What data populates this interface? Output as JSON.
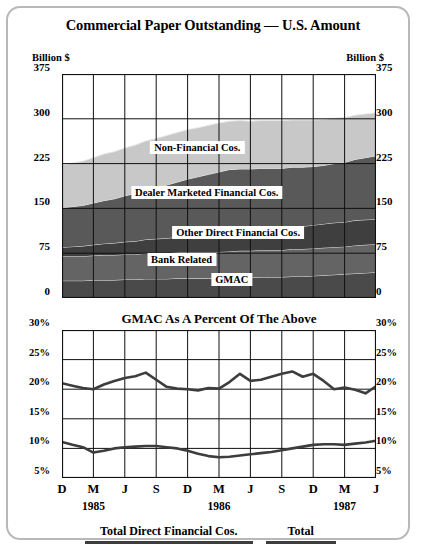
{
  "title": "Commercial Paper Outstanding — U.S. Amount",
  "subtitle": "GMAC As A Percent Of The Above",
  "unit_label_left": "Billion $",
  "unit_label_right": "Billion $",
  "axis": {
    "top_yticks": [
      "375",
      "300",
      "225",
      "150",
      "75",
      "0"
    ],
    "bottom_yticks": [
      "30%",
      "25%",
      "20%",
      "15%",
      "10%",
      "5%"
    ],
    "xticks": [
      "D",
      "M",
      "J",
      "S",
      "D",
      "M",
      "J",
      "S",
      "D",
      "M",
      "J"
    ],
    "years": [
      {
        "label": "1985",
        "at": 1
      },
      {
        "label": "1986",
        "at": 5
      },
      {
        "label": "1987",
        "at": 9
      }
    ]
  },
  "legend": [
    {
      "label": "Total Direct Financial Cos.",
      "color": "#3d3d3d"
    },
    {
      "label": "Total",
      "color": "#3d3d3d"
    }
  ],
  "band_labels": [
    {
      "text": "Non-Financial Cos.",
      "x": 0.45,
      "y": 0.355
    },
    {
      "text": "Dealer Marketed Financial Cos.",
      "x": 0.48,
      "y": 0.56
    },
    {
      "text": "Other Direct Financial Cos.",
      "x": 0.58,
      "y": 0.735
    },
    {
      "text": "Bank Related",
      "x": 0.4,
      "y": 0.855
    },
    {
      "text": "GMAC",
      "x": 0.56,
      "y": 0.945
    }
  ],
  "chart_data": [
    {
      "type": "area",
      "title": "Commercial Paper Outstanding — U.S. Amount",
      "ylabel": "Billion $",
      "xlabel": "",
      "ylim": [
        0,
        375
      ],
      "grid": true,
      "stacked": true,
      "x": [
        "D 1985",
        "J",
        "F",
        "M 1985",
        "A",
        "M",
        "J 1985",
        "J",
        "A",
        "S 1985",
        "O",
        "N",
        "D 1986",
        "J",
        "F",
        "M 1986",
        "A",
        "M",
        "J 1986",
        "J",
        "A",
        "S 1986",
        "O",
        "N",
        "D 1987",
        "J",
        "F",
        "M 1987",
        "A",
        "M",
        "J 1987"
      ],
      "series": [
        {
          "name": "GMAC",
          "color": "#4a4a4a",
          "values": [
            29,
            29,
            29,
            30,
            30,
            30,
            31,
            31,
            32,
            32,
            32,
            33,
            33,
            33,
            33,
            33,
            34,
            34,
            34,
            35,
            35,
            35,
            36,
            36,
            37,
            38,
            39,
            40,
            41,
            42,
            43
          ]
        },
        {
          "name": "Bank Related",
          "color": "#646464",
          "values": [
            41,
            41,
            41,
            41,
            42,
            42,
            42,
            42,
            43,
            43,
            43,
            43,
            44,
            44,
            44,
            44,
            44,
            45,
            45,
            45,
            45,
            45,
            46,
            46,
            46,
            46,
            46,
            46,
            47,
            47,
            47
          ]
        },
        {
          "name": "Other Direct Financial Cos.",
          "color": "#3f3f3f",
          "values": [
            15,
            16,
            17,
            18,
            19,
            20,
            21,
            22,
            23,
            24,
            25,
            26,
            27,
            28,
            29,
            30,
            31,
            32,
            33,
            34,
            35,
            36,
            37,
            38,
            39,
            40,
            41,
            41,
            42,
            42,
            42
          ]
        },
        {
          "name": "Dealer Marketed Financial Cos.",
          "color": "#595959",
          "values": [
            66,
            67,
            68,
            70,
            72,
            74,
            77,
            80,
            83,
            86,
            89,
            92,
            95,
            98,
            101,
            104,
            106,
            105,
            104,
            103,
            102,
            101,
            100,
            99,
            98,
            98,
            99,
            100,
            102,
            104,
            106
          ]
        },
        {
          "name": "Non-Financial Cos.",
          "color": "#c8c8c8",
          "values": [
            72,
            73,
            74,
            76,
            78,
            79,
            80,
            81,
            82,
            82,
            83,
            83,
            83,
            82,
            82,
            82,
            81,
            81,
            80,
            80,
            80,
            80,
            79,
            79,
            78,
            77,
            76,
            75,
            74,
            73,
            72
          ]
        }
      ]
    },
    {
      "type": "line",
      "title": "GMAC As A Percent Of The Above",
      "ylabel": "%",
      "xlabel": "",
      "ylim": [
        5,
        30
      ],
      "grid": true,
      "x": [
        "D 1985",
        "J",
        "F",
        "M 1985",
        "A",
        "M",
        "J 1985",
        "J",
        "A",
        "S 1985",
        "O",
        "N",
        "D 1986",
        "J",
        "F",
        "M 1986",
        "A",
        "M",
        "J 1986",
        "J",
        "A",
        "S 1986",
        "O",
        "N",
        "D 1987",
        "J",
        "F",
        "M 1987",
        "A",
        "M",
        "J 1987"
      ],
      "series": [
        {
          "name": "Total Direct Financial Cos.",
          "color": "#3d3d3d",
          "values": [
            21.0,
            20.6,
            20.2,
            20.0,
            20.8,
            21.4,
            21.9,
            22.2,
            22.8,
            21.6,
            20.4,
            20.1,
            20.0,
            19.8,
            20.2,
            20.1,
            21.2,
            22.6,
            21.4,
            21.6,
            22.1,
            22.6,
            23.0,
            22.1,
            22.6,
            21.4,
            20.0,
            20.3,
            19.9,
            19.3,
            20.5
          ]
        },
        {
          "name": "Total",
          "color": "#3d3d3d",
          "values": [
            11.1,
            10.6,
            10.2,
            9.3,
            9.6,
            10.0,
            10.2,
            10.3,
            10.4,
            10.4,
            10.2,
            10.0,
            9.6,
            9.1,
            8.7,
            8.5,
            8.6,
            8.8,
            9.0,
            9.2,
            9.4,
            9.7,
            10.0,
            10.3,
            10.6,
            10.7,
            10.7,
            10.6,
            10.8,
            11.0,
            11.3
          ]
        }
      ],
      "extra_points": {
        "upper_tail": [
          21.6,
          22.0,
          23.0,
          23.3,
          23.8
        ],
        "note": "upper series rises to ~24% at final point"
      }
    }
  ]
}
